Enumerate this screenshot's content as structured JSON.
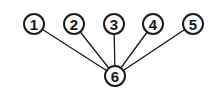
{
  "diagram": {
    "type": "star-graph",
    "nodes": [
      {
        "id": "1",
        "label": "1",
        "x": 34,
        "y": 24
      },
      {
        "id": "2",
        "label": "2",
        "x": 74,
        "y": 24
      },
      {
        "id": "3",
        "label": "3",
        "x": 114,
        "y": 24
      },
      {
        "id": "4",
        "label": "4",
        "x": 153,
        "y": 24
      },
      {
        "id": "5",
        "label": "5",
        "x": 193,
        "y": 24
      },
      {
        "id": "6",
        "label": "6",
        "x": 115,
        "y": 76
      }
    ],
    "edges": [
      {
        "from": "1",
        "to": "6"
      },
      {
        "from": "2",
        "to": "6"
      },
      {
        "from": "3",
        "to": "6"
      },
      {
        "from": "4",
        "to": "6"
      },
      {
        "from": "5",
        "to": "6"
      }
    ],
    "node_radius": 10,
    "colors": {
      "stroke": "#1a1a1a",
      "fill": "#ffffff",
      "background": "#ffffff"
    }
  }
}
